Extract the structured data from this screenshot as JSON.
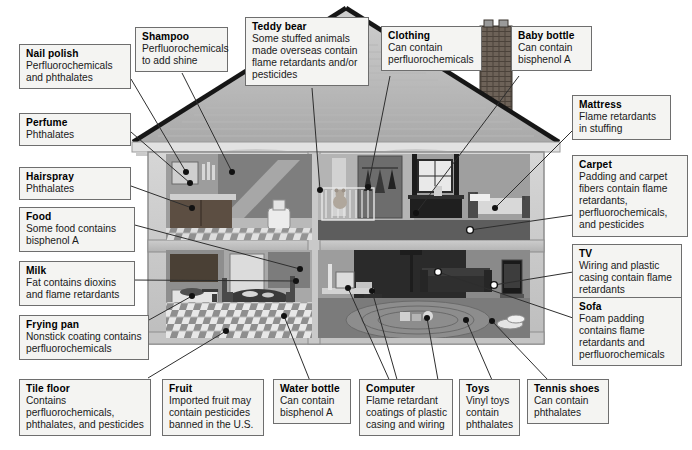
{
  "diagram": {
    "background_color": "#ffffff",
    "box_fill_color": "#f4f4f2",
    "box_border_color": "#6e6e6e",
    "leader_line_color": "#2e2e2e"
  },
  "callouts": [
    {
      "id": "nail-polish",
      "title": "Nail polish",
      "body": "Perfluorochemicals and phthalates"
    },
    {
      "id": "perfume",
      "title": "Perfume",
      "body": "Phthalates"
    },
    {
      "id": "hairspray",
      "title": "Hairspray",
      "body": "Phthalates"
    },
    {
      "id": "food",
      "title": "Food",
      "body": "Some food contains bisphenol A"
    },
    {
      "id": "milk",
      "title": "Milk",
      "body": "Fat contains dioxins and flame retardants"
    },
    {
      "id": "frying-pan",
      "title": "Frying pan",
      "body": "Nonstick coating contains perfluorochemicals"
    },
    {
      "id": "tile-floor",
      "title": "Tile floor",
      "body": "Contains perfluorochemicals, phthalates, and pesticides"
    },
    {
      "id": "shampoo",
      "title": "Shampoo",
      "body": "Perfluorochemicals to add shine"
    },
    {
      "id": "teddy-bear",
      "title": "Teddy bear",
      "body": "Some stuffed animals made overseas contain flame retardants and/or pesticides"
    },
    {
      "id": "clothing",
      "title": "Clothing",
      "body": "Can contain perfluorochemicals"
    },
    {
      "id": "baby-bottle",
      "title": "Baby bottle",
      "body": "Can contain bisphenol A"
    },
    {
      "id": "mattress",
      "title": "Mattress",
      "body": "Flame retardants in stuffing"
    },
    {
      "id": "carpet",
      "title": "Carpet",
      "body": "Padding and carpet fibers contain flame retardants, perfluorochemicals, and pesticides"
    },
    {
      "id": "tv",
      "title": "TV",
      "body": "Wiring and plastic casing contain flame retardants"
    },
    {
      "id": "sofa",
      "title": "Sofa",
      "body": "Foam padding contains flame retardants and perfluorochemicals"
    },
    {
      "id": "fruit",
      "title": "Fruit",
      "body": "Imported fruit may contain pesticides banned in the U.S."
    },
    {
      "id": "water-bottle",
      "title": "Water bottle",
      "body": "Can contain bisphenol A"
    },
    {
      "id": "computer",
      "title": "Computer",
      "body": "Flame retardant coatings of plastic casing and wiring"
    },
    {
      "id": "toys",
      "title": "Toys",
      "body": "Vinyl toys contain phthalates"
    },
    {
      "id": "tennis-shoes",
      "title": "Tennis shoes",
      "body": "Can contain phthalates"
    }
  ],
  "house": {
    "rooms": [
      {
        "id": "bathroom",
        "label": "bathroom"
      },
      {
        "id": "nursery",
        "label": "nursery / bedroom"
      },
      {
        "id": "kitchen",
        "label": "kitchen"
      },
      {
        "id": "living-room",
        "label": "living room"
      }
    ],
    "features": [
      "roof",
      "chimney",
      "upper-floor",
      "lower-floor",
      "foundation"
    ]
  }
}
